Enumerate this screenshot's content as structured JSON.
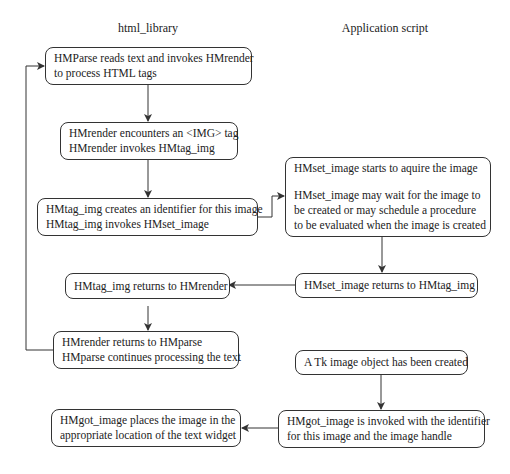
{
  "columns": {
    "left": "html_library",
    "right": "Application script"
  },
  "nodes": {
    "hmparse_reads": [
      "HMParse reads text and invokes HMrender",
      "to process HTML tags"
    ],
    "hmrender_encounters": [
      "HMrender encounters an <IMG> tag",
      "HMrender invokes HMtag_img"
    ],
    "hmtag_img_creates": [
      "HMtag_img creates an identifier for this image",
      "HMtag_img invokes HMset_image"
    ],
    "hmset_image_starts": {
      "line1": "HMset_image starts to aquire the image",
      "para": [
        "HMset_image may wait for the image to",
        "be created or may schedule a procedure",
        "to be evaluated when the image is created"
      ]
    },
    "hmtag_img_returns": [
      "HMtag_img returns to HMrender"
    ],
    "hmset_image_returns": [
      "HMset_image returns to HMtag_img"
    ],
    "hmrender_returns": [
      "HMrender returns to HMparse",
      "HMparse continues processing the text"
    ],
    "tk_image_created": [
      "A Tk image object has been created"
    ],
    "hmgot_image_places": [
      "HMgot_image places the image in the",
      "appropriate location of the text widget"
    ],
    "hmgot_image_invoked": [
      "HMgot_image is invoked with the identifier",
      "for this image and the image handle"
    ]
  },
  "edges": [
    {
      "from": "hmparse_reads",
      "to": "hmrender_encounters"
    },
    {
      "from": "hmrender_encounters",
      "to": "hmtag_img_creates"
    },
    {
      "from": "hmtag_img_creates",
      "to": "hmset_image_starts"
    },
    {
      "from": "hmset_image_starts",
      "to": "hmset_image_returns"
    },
    {
      "from": "hmset_image_returns",
      "to": "hmtag_img_returns"
    },
    {
      "from": "hmtag_img_returns",
      "to": "hmrender_returns"
    },
    {
      "from": "hmrender_returns",
      "to": "hmparse_reads"
    },
    {
      "from": "tk_image_created",
      "to": "hmgot_image_invoked"
    },
    {
      "from": "hmgot_image_invoked",
      "to": "hmgot_image_places"
    }
  ],
  "colors": {
    "stroke": "#333333",
    "background": "#ffffff",
    "text": "#222222"
  }
}
